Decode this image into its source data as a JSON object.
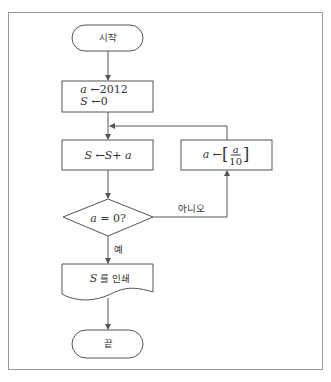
{
  "flowchart": {
    "start": {
      "label": "시작"
    },
    "init": {
      "line1": {
        "var": "a",
        "arrow": "←",
        "value": "2012"
      },
      "line2": {
        "var": "S",
        "arrow": "←",
        "value": "0"
      }
    },
    "accumulate": {
      "var": "S",
      "arrow": "←",
      "expr_var1": "S",
      "op": "+",
      "expr_var2": "a"
    },
    "update": {
      "var": "a",
      "arrow": "←",
      "lbracket": "[",
      "numerator": "a",
      "denominator": "10",
      "rbracket": "]"
    },
    "decision": {
      "expr": "a",
      "op": " = ",
      "value": "0?"
    },
    "branch_no": "아니오",
    "branch_yes": "예",
    "output": {
      "var": "S",
      "text": " 를 인쇄"
    },
    "end": {
      "label": "끝"
    }
  },
  "colors": {
    "stroke": "#555555",
    "frame": "#9a9a9a",
    "text": "#333333",
    "background": "#ffffff"
  }
}
